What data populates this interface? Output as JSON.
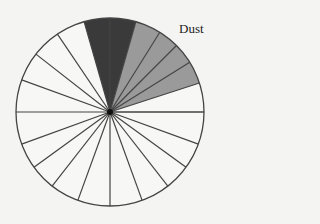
{
  "diagram": {
    "type": "sector-wheel",
    "center": [
      110,
      112
    ],
    "radius": 94,
    "sector_count": 24,
    "boundary_angles_deg": [
      0,
      18,
      32,
      45,
      58,
      74,
      90,
      106,
      124,
      142,
      160,
      180,
      200,
      216,
      232,
      250,
      270,
      290,
      308,
      324,
      340,
      360
    ],
    "colors": {
      "background": "#f4f4f2",
      "stroke": "#444444",
      "white": "#f7f7f5",
      "dark": "#3a3a3a",
      "grey": "#9a9a9a",
      "hub": "#111111"
    },
    "shaded_sectors": [
      {
        "from": 74,
        "to": 90,
        "fill": "dark"
      },
      {
        "from": 90,
        "to": 106,
        "fill": "dark"
      },
      {
        "from": 58,
        "to": 74,
        "fill": "grey"
      },
      {
        "from": 45,
        "to": 58,
        "fill": "grey"
      },
      {
        "from": 32,
        "to": 45,
        "fill": "grey"
      },
      {
        "from": 18,
        "to": 32,
        "fill": "grey"
      }
    ],
    "labels": [
      {
        "text": "Dust",
        "x": 179,
        "y": 21
      }
    ]
  }
}
